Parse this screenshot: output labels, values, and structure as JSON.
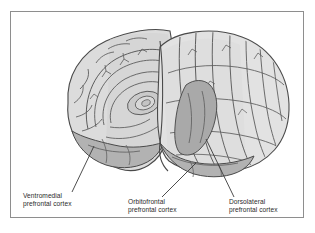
{
  "figure": {
    "kind": "anatomical-illustration",
    "frame_color": "#8e8e8e",
    "background_color": "#ffffff"
  },
  "palette": {
    "outline": "#4a4a4a",
    "cortex_light": "#e8e8e8",
    "cortex_mid": "#cfcfcf",
    "cortex_shaded": "#b9b9b9",
    "region_highlight": "#a8a8a8",
    "sulcus_line": "#5c5c5c",
    "leader_line": "#3a3a3a",
    "text": "#2b2b2b"
  },
  "labels": [
    {
      "id": "ventromedial",
      "line1": "Ventromedial",
      "line2": "prefrontal cortex"
    },
    {
      "id": "orbitofrontal",
      "line1": "Orbitofrontal",
      "line2": "prefrontal cortex"
    },
    {
      "id": "dorsolateral",
      "line1": "Dorsolateral",
      "line2": "prefrontal cortex"
    }
  ]
}
